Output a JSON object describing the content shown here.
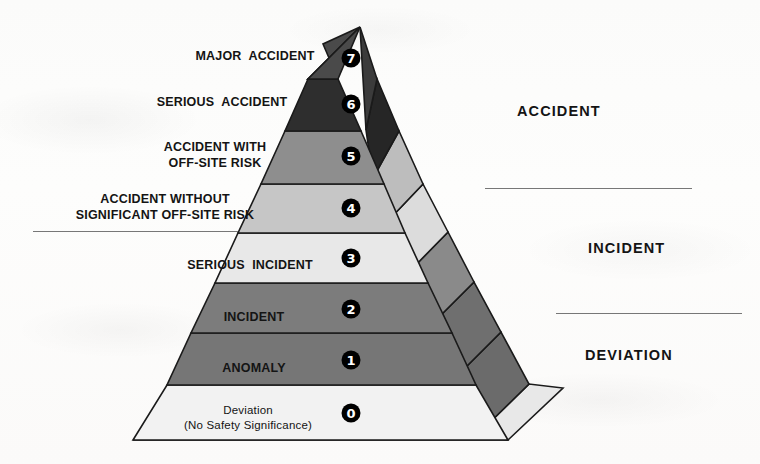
{
  "diagram": {
    "type": "pyramid",
    "colors": {
      "level7": "#4a4a4a",
      "level6": "#2e2e2e",
      "level5": "#8e8e8e",
      "level4": "#c6c6c6",
      "level3": "#e8e8e8",
      "level2": "#7c7c7c",
      "level1": "#767676",
      "level0": "#f2f2f2",
      "outline": "#1a1a1a",
      "text": "#141414",
      "divider": "#777777",
      "background": "#fdfdfc"
    }
  },
  "levels": [
    {
      "number": "7",
      "label": "MAJOR  ACCIDENT",
      "label_line2": "",
      "category": "ACCIDENT",
      "fill": "#4a4a4a",
      "side_fill": "#3b3b3b"
    },
    {
      "number": "6",
      "label": "SERIOUS  ACCIDENT",
      "label_line2": "",
      "category": "ACCIDENT",
      "fill": "#2e2e2e",
      "side_fill": "#262626"
    },
    {
      "number": "5",
      "label": "ACCIDENT WITH",
      "label_line2": "OFF-SITE RISK",
      "category": "ACCIDENT",
      "fill": "#8e8e8e",
      "side_fill": "#b9b9b9"
    },
    {
      "number": "4",
      "label": "ACCIDENT WITHOUT",
      "label_line2": "SIGNIFICANT OFF-SITE RISK",
      "category": "ACCIDENT",
      "fill": "#c6c6c6",
      "side_fill": "#dcdcdc"
    },
    {
      "number": "3",
      "label": "SERIOUS  INCIDENT",
      "label_line2": "",
      "category": "INCIDENT",
      "fill": "#e8e8e8",
      "side_fill": "#8a8a8a"
    },
    {
      "number": "2",
      "label": "INCIDENT",
      "label_line2": "",
      "category": "INCIDENT",
      "fill": "#7c7c7c",
      "side_fill": "#6f6f6f"
    },
    {
      "number": "1",
      "label": "ANOMALY",
      "label_line2": "",
      "category": "DEVIATION",
      "fill": "#767676",
      "side_fill": "#6b6b6b"
    },
    {
      "number": "0",
      "label": "Deviation",
      "label_line2": "(No Safety Significance)",
      "category": "DEVIATION",
      "fill": "#f2f2f2",
      "side_fill": "#e3e3e3"
    }
  ],
  "categories": [
    {
      "name": "ACCIDENT",
      "x": 517,
      "y": 110
    },
    {
      "name": "INCIDENT",
      "x": 588,
      "y": 247
    },
    {
      "name": "DEVIATION",
      "x": 585,
      "y": 354
    }
  ],
  "dividers": [
    {
      "name": "accident-incident-right",
      "x": 485,
      "y": 188,
      "width": 207
    },
    {
      "name": "accident-incident-left",
      "x": 33,
      "y": 231,
      "width": 205
    },
    {
      "name": "incident-deviation",
      "x": 556,
      "y": 313,
      "width": 186
    }
  ]
}
